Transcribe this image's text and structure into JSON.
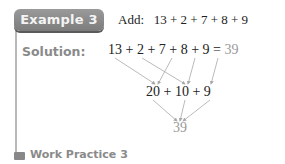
{
  "example": {
    "badge_label": "Example 3",
    "prompt_label": "Add:",
    "prompt_expression": "13 + 2 + 7 + 8 + 9"
  },
  "solution": {
    "label": "Solution:",
    "line1_expression": "13 + 2 + 7 + 8 + 9 =",
    "line1_result": "39",
    "line2_expression": "20 + 10 + 9",
    "line3_result": "39",
    "groupings": [
      {
        "from": [
          "13",
          "7"
        ],
        "to": "20"
      },
      {
        "from": [
          "2",
          "8"
        ],
        "to": "10"
      },
      {
        "from": [
          "9"
        ],
        "to": "9"
      },
      {
        "from": [
          "20",
          "10",
          "9"
        ],
        "to": "39"
      }
    ]
  },
  "work_practice": {
    "label": "Work Practice 3"
  },
  "colors": {
    "badge_bg": "#8a8a8a",
    "label_gray": "#8a8a8a",
    "result_gray": "#999999",
    "arrow_gray": "#a8a8a8",
    "rule_gray": "#b8b8b8"
  }
}
